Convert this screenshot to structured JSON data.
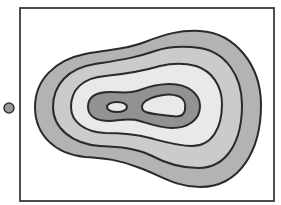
{
  "diagram": {
    "type": "contour-map",
    "frame": {
      "x": 20,
      "y": 8,
      "width": 254,
      "height": 193,
      "stroke": "#3a3a3a"
    },
    "marker": {
      "cx": 9,
      "cy": 108,
      "r": 5,
      "fill": "#999999",
      "stroke": "#333333"
    },
    "stroke_color": "#2a2a2a",
    "levels": [
      {
        "name": "contour-level-1",
        "fill": "#b3b3b3"
      },
      {
        "name": "contour-level-2",
        "fill": "#cbcbcb"
      },
      {
        "name": "contour-level-3",
        "fill": "#e9e9e9"
      },
      {
        "name": "contour-level-4",
        "fill": "#929292"
      },
      {
        "name": "peak-left",
        "fill": "#e9e9e9"
      },
      {
        "name": "peak-right",
        "fill": "#e9e9e9"
      }
    ]
  }
}
